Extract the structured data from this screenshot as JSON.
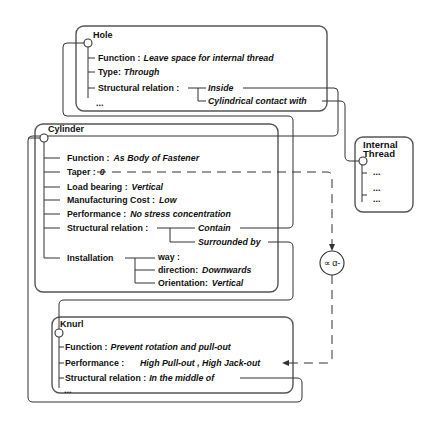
{
  "diagram": {
    "nodes": {
      "hole": {
        "title": "Hole",
        "attributes": [
          {
            "label": "Function :",
            "value": "Leave space for internal thread"
          },
          {
            "label": "Type:",
            "value": "Through"
          },
          {
            "label": "Structural relation :",
            "values": [
              "Inside",
              "Cylindrical contact with"
            ]
          }
        ],
        "more": "..."
      },
      "cylinder": {
        "title": "Cylinder",
        "attributes": [
          {
            "label": "Function :",
            "value": "As Body of Fastener"
          },
          {
            "label": "Taper :",
            "value": "0"
          },
          {
            "label": "Load bearing :",
            "value": "Vertical"
          },
          {
            "label": "Manufacturing Cost :",
            "value": "Low"
          },
          {
            "label": "Performance :",
            "value": "No stress concentration"
          },
          {
            "label": "Structural relation :",
            "values": [
              "Contain",
              "Surrounded by"
            ]
          },
          {
            "label": "Installation",
            "children": [
              {
                "label": "way :",
                "value": ""
              },
              {
                "label": "direction:",
                "value": "Downwards"
              },
              {
                "label": "Orientation:",
                "value": "Vertical"
              }
            ]
          }
        ]
      },
      "knurl": {
        "title": "Knurl",
        "attributes": [
          {
            "label": "Function :",
            "value": "Prevent rotation and pull-out"
          },
          {
            "label": "Performance :",
            "value": "High Pull-out , High Jack-out"
          },
          {
            "label": "Structural relation :",
            "value": "In the middle of"
          }
        ],
        "more": "..."
      },
      "internal_thread": {
        "title_line1": "Internal",
        "title_line2": "Thread",
        "items": [
          "...",
          "...",
          "..."
        ]
      }
    },
    "constraint_symbol": "∝ α-",
    "links": [
      {
        "from": "hole.Inside",
        "to": "cylinder"
      },
      {
        "from": "hole.Cylindrical contact with",
        "to": "internal_thread"
      },
      {
        "from": "cylinder.Contain",
        "to": "hole"
      },
      {
        "from": "cylinder.Surrounded by",
        "to": "knurl"
      },
      {
        "from": "knurl.In the middle of",
        "to": "cylinder"
      },
      {
        "from": "cylinder.Taper",
        "to": "knurl.Performance",
        "style": "dashed",
        "via": "constraint_symbol"
      }
    ]
  },
  "colors": {
    "background": "#ffffff",
    "line": "#333333",
    "box_border": "#555555",
    "text": "#111111"
  }
}
